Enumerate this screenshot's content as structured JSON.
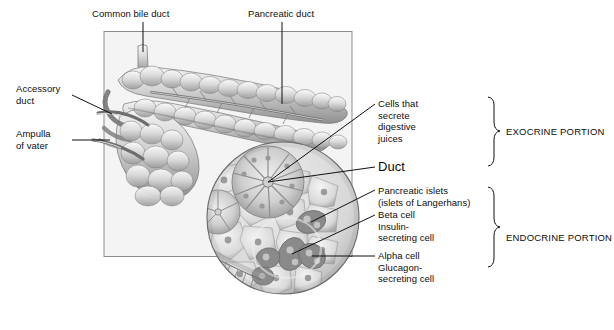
{
  "figure": {
    "background_color": "#ffffff",
    "panel_fill": "#f4f4f4",
    "panel_border": "#8d8d8d",
    "ink": "#111111"
  },
  "labels": {
    "common_bile_duct": "Common bile duct",
    "pancreatic_duct": "Pancreatic duct",
    "accessory_duct": "Accessory\nduct",
    "ampulla_of_vater": "Ampulla\nof vater",
    "cells_that_secrete": "Cells that\nsecrete\ndigestive\njuices",
    "duct": "Duct",
    "pancreatic_islets": "Pancreatic islets\n(islets of Langerhans)",
    "beta_cell": "Beta cell\nInsulin-\nsecreting cell",
    "alpha_cell": "Alpha cell\nGlucagon-\nsecreting cell"
  },
  "groups": {
    "exocrine": "EXOCRINE PORTION",
    "endocrine": "ENDOCRINE PORTION"
  },
  "icons": {
    "pancreas": "pancreas-organ-icon",
    "duodenum": "duodenum-icon",
    "histology_circle": "histology-inset-icon",
    "brace_exocrine": "curly-brace-icon",
    "brace_endocrine": "curly-brace-icon"
  }
}
